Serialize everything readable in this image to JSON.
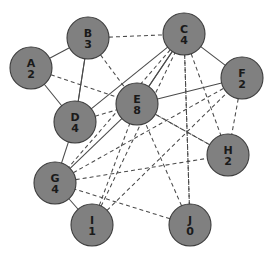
{
  "figure": {
    "background_color": "#ffffff",
    "node_fill_color": "#808080",
    "node_stroke_color": "#3c3c3c",
    "edge_color": "#4a4a4a",
    "label_color": "#1a1a1a",
    "node_radius": 21,
    "width": 275,
    "height": 261
  },
  "nodes": [
    {
      "id": "A",
      "label": "A",
      "count": "2",
      "x": 31,
      "y": 68
    },
    {
      "id": "B",
      "label": "B",
      "count": "3",
      "x": 88,
      "y": 38
    },
    {
      "id": "C",
      "label": "C",
      "count": "4",
      "x": 184,
      "y": 34
    },
    {
      "id": "D",
      "label": "D",
      "count": "4",
      "x": 75,
      "y": 122
    },
    {
      "id": "E",
      "label": "E",
      "count": "8",
      "x": 137,
      "y": 104
    },
    {
      "id": "F",
      "label": "F",
      "count": "2",
      "x": 242,
      "y": 78
    },
    {
      "id": "G",
      "label": "G",
      "count": "4",
      "x": 55,
      "y": 183
    },
    {
      "id": "H",
      "label": "H",
      "count": "2",
      "x": 228,
      "y": 155
    },
    {
      "id": "I",
      "label": "I",
      "count": "1",
      "x": 92,
      "y": 225
    },
    {
      "id": "J",
      "label": "J",
      "count": "0",
      "x": 190,
      "y": 225
    }
  ],
  "edges": [
    {
      "from": "B",
      "to": "A",
      "style": "solid"
    },
    {
      "from": "A",
      "to": "D",
      "style": "solid"
    },
    {
      "from": "B",
      "to": "D",
      "style": "solid"
    },
    {
      "from": "D",
      "to": "B",
      "style": "solid"
    },
    {
      "from": "B",
      "to": "C",
      "style": "dashed"
    },
    {
      "from": "B",
      "to": "E",
      "style": "dashed"
    },
    {
      "from": "C",
      "to": "E",
      "style": "solid"
    },
    {
      "from": "C",
      "to": "F",
      "style": "solid"
    },
    {
      "from": "C",
      "to": "D",
      "style": "solid"
    },
    {
      "from": "C",
      "to": "J",
      "style": "dashed"
    },
    {
      "from": "C",
      "to": "H",
      "style": "dashed"
    },
    {
      "from": "C",
      "to": "G",
      "style": "dashed"
    },
    {
      "from": "A",
      "to": "E",
      "style": "dashed"
    },
    {
      "from": "D",
      "to": "E",
      "style": "dashed"
    },
    {
      "from": "E",
      "to": "H",
      "style": "dashed"
    },
    {
      "from": "F",
      "to": "H",
      "style": "dashed"
    },
    {
      "from": "G",
      "to": "E",
      "style": "solid"
    },
    {
      "from": "G",
      "to": "F",
      "style": "dashed"
    },
    {
      "from": "G",
      "to": "H",
      "style": "dashed"
    },
    {
      "from": "D",
      "to": "G",
      "style": "solid"
    },
    {
      "from": "G",
      "to": "I",
      "style": "solid"
    },
    {
      "from": "I",
      "to": "E",
      "style": "dashed"
    },
    {
      "from": "I",
      "to": "C",
      "style": "dashed"
    },
    {
      "from": "J",
      "to": "E",
      "style": "dashed"
    },
    {
      "from": "J",
      "to": "G",
      "style": "dashed"
    },
    {
      "from": "J",
      "to": "C",
      "style": "dashed"
    },
    {
      "from": "H",
      "to": "E",
      "style": "dashed"
    },
    {
      "from": "F",
      "to": "E",
      "style": "solid"
    },
    {
      "from": "I",
      "to": "F",
      "style": "dashed"
    },
    {
      "from": "E",
      "to": "C",
      "style": "solid"
    }
  ],
  "legend": {
    "solid_meaning": "solid edge",
    "dashed_meaning": "dashed edge"
  }
}
